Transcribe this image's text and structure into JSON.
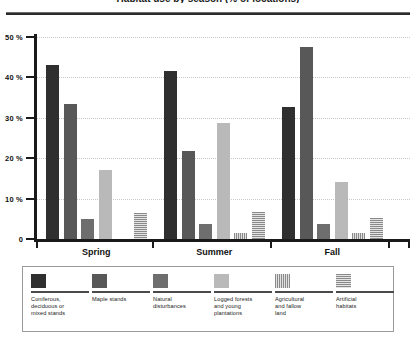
{
  "figure": {
    "title_fragment": "Habitat use by season (% of locations)"
  },
  "chart_data": {
    "type": "bar",
    "title": "",
    "xlabel": "",
    "ylabel": "",
    "ylim": [
      0,
      50
    ],
    "yticks": [
      0,
      10,
      20,
      30,
      40,
      50
    ],
    "ytick_labels": [
      "0",
      "10 %",
      "20 %",
      "30 %",
      "40 %",
      "50 %"
    ],
    "grid": true,
    "legend_position": "bottom",
    "categories": [
      "Spring",
      "Summer",
      "Fall"
    ],
    "series": [
      {
        "name": "Coniferous, deciduous or mixed stands",
        "values": [
          43,
          41.5,
          32.8
        ]
      },
      {
        "name": "Maple stands",
        "values": [
          33.5,
          21.8,
          47.5
        ]
      },
      {
        "name": "Natural disturbances",
        "values": [
          5,
          3.6,
          3.8
        ]
      },
      {
        "name": "Logged forests and young plantations",
        "values": [
          17.2,
          28.6,
          14
        ]
      },
      {
        "name": "Agricultural and fallow land",
        "values": [
          0,
          1.5,
          1.6
        ]
      },
      {
        "name": "Artificial habitats",
        "values": [
          6.5,
          6.6,
          5.3
        ]
      }
    ]
  },
  "legend": {
    "items": [
      {
        "label": "Coniferous,\ndeciduous or\nmixed stands",
        "swatch": "series-1-swatch"
      },
      {
        "label": "Maple stands",
        "swatch": "series-2-swatch"
      },
      {
        "label": "Natural\ndisturbances",
        "swatch": "series-3-swatch"
      },
      {
        "label": "Logged forests\nand young\nplantations",
        "swatch": "series-4-swatch"
      },
      {
        "label": "Agricultural\nand fallow\nland",
        "swatch": "series-5-swatch"
      },
      {
        "label": "Artificial\nhabitats",
        "swatch": "series-6-swatch"
      }
    ]
  },
  "colors": {
    "series_1": "#2f2f2f",
    "series_2": "#585858",
    "series_3": "#6e6e6e",
    "series_4": "#b9b9b9",
    "series_5": "#8a8a8a",
    "series_6": "#8a8a8a",
    "axis": "#1a1a1a",
    "grid": "#c9c9c9"
  }
}
